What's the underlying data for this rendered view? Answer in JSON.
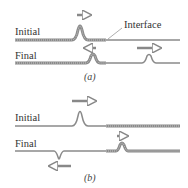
{
  "panel_a": {
    "initial_label": "Initial",
    "final_label": "Final",
    "interface_label": "Interface",
    "caption": "(a)"
  },
  "panel_b": {
    "initial_label": "Initial",
    "final_label": "Final",
    "caption": "(b)"
  },
  "colors": {
    "string": "#8a8a8a",
    "heavy_string": "#777777",
    "arrow": "#888888"
  }
}
